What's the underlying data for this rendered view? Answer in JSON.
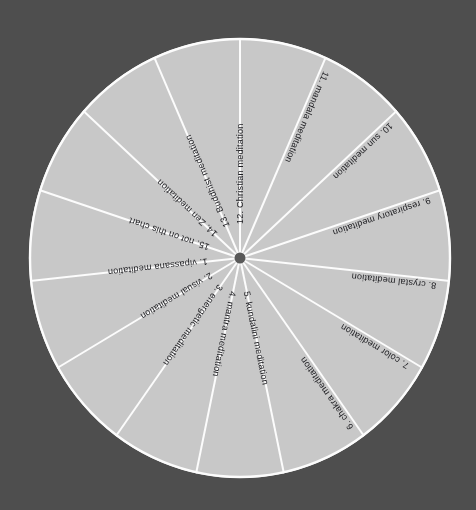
{
  "chart_data": {
    "type": "pie",
    "title": "",
    "subtitle": "",
    "xlabel": "",
    "ylabel": "",
    "legend_position": "none",
    "grid": false,
    "slice_count": 15,
    "equal_slices": true,
    "slice_angle_degrees": 24,
    "start_angle_degrees": 0,
    "direction": "clockwise",
    "categories": [
      "1. vipassana meditation",
      "2. visual meditation",
      "3. energetic meditation",
      "4. mantra meditation",
      "5. kundalini meditation",
      "6. chakra meditation",
      "7. color meditation",
      "8. crystal meditation",
      "9. respiratory meditation",
      "10. sun meditation",
      "11. mandala meditation",
      "12. Christian meditation",
      "13. Buddhist meditation",
      "14. Zen meditation",
      "15. not on this chart"
    ],
    "values": [
      6.667,
      6.667,
      6.667,
      6.667,
      6.667,
      6.667,
      6.667,
      6.667,
      6.667,
      6.667,
      6.667,
      6.667,
      6.667,
      6.667,
      6.667
    ],
    "value_unit": "percent"
  },
  "colors": {
    "background": "#4e4e4e",
    "slice_fill": "#c8c8c8",
    "divider": "#fcfcfc",
    "hub": "#5a5a5a",
    "label_text": "#1c1c20"
  },
  "wheel": {
    "center_x": 240,
    "center_y": 258,
    "radius_x": 211,
    "radius_y": 220,
    "hub_radius": 5.5
  },
  "slices": [
    {
      "index": 1,
      "label": "1.  vipassana meditation",
      "mid_angle": 264,
      "flip": false
    },
    {
      "index": 2,
      "label": "2.  visual meditation",
      "mid_angle": 240,
      "flip": false
    },
    {
      "index": 3,
      "label": "3.  energetic meditation",
      "mid_angle": 216,
      "flip": false
    },
    {
      "index": 4,
      "label": "4.  mantra meditation",
      "mid_angle": 192,
      "flip": false
    },
    {
      "index": 5,
      "label": "5.  kundalini meditation",
      "mid_angle": 168,
      "flip": false
    },
    {
      "index": 6,
      "label": "6.  chakra meditation",
      "mid_angle": 144,
      "flip": true
    },
    {
      "index": 7,
      "label": "7.  color meditation",
      "mid_angle": 120,
      "flip": true
    },
    {
      "index": 8,
      "label": "8.  crystal meditation",
      "mid_angle": 96,
      "flip": true
    },
    {
      "index": 9,
      "label": "9.  respiratory meditation",
      "mid_angle": 72,
      "flip": true
    },
    {
      "index": 10,
      "label": "10.  sun meditation",
      "mid_angle": 48,
      "flip": true
    },
    {
      "index": 11,
      "label": "11.  mandala meditation",
      "mid_angle": 24,
      "flip": true
    },
    {
      "index": 12,
      "label": "12.  Christian meditation",
      "mid_angle": 0,
      "flip": false
    },
    {
      "index": 13,
      "label": "13.  Buddhist meditation",
      "mid_angle": 336,
      "flip": false
    },
    {
      "index": 14,
      "label": "14.  Zen meditation",
      "mid_angle": 312,
      "flip": false
    },
    {
      "index": 15,
      "label": "15.  not on this chart",
      "mid_angle": 288,
      "flip": false
    }
  ]
}
